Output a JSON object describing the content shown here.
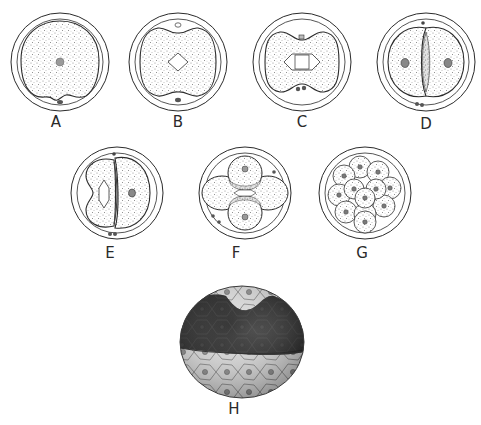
{
  "figure": {
    "top_cut_text": "",
    "stages": [
      {
        "id": "A",
        "label": "A",
        "desc": "fertilized egg"
      },
      {
        "id": "B",
        "label": "B",
        "desc": "first mitotic spindle"
      },
      {
        "id": "C",
        "label": "C",
        "desc": "cleavage furrow forming"
      },
      {
        "id": "D",
        "label": "D",
        "desc": "two-cell stage"
      },
      {
        "id": "E",
        "label": "E",
        "desc": "two-cell, one dividing"
      },
      {
        "id": "F",
        "label": "F",
        "desc": "four-cell stage"
      },
      {
        "id": "G",
        "label": "G",
        "desc": "morula"
      },
      {
        "id": "H",
        "label": "H",
        "desc": "blastocyst cutaway"
      }
    ]
  },
  "colors": {
    "line": "#2b2b2b",
    "stipple": "#8a8a8a",
    "cavity": "#1e1e1e",
    "background": "#ffffff"
  }
}
